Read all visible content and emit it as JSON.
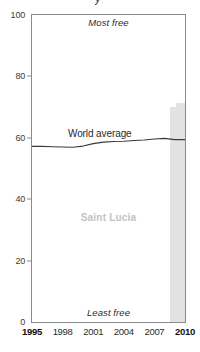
{
  "chart_data": {
    "type": "line",
    "title": "",
    "xlabel": "",
    "ylabel": "",
    "xlim": [
      1995,
      2010
    ],
    "ylim": [
      0,
      100
    ],
    "grid": false,
    "legend_position": "inline-annotation",
    "x_tick_labels": [
      "1995",
      "1998",
      "2001",
      "2004",
      "2007",
      "2010"
    ],
    "x_tick_values": [
      1995,
      1998,
      2001,
      2004,
      2007,
      2010
    ],
    "x_tick_emphasis": [
      true,
      false,
      false,
      false,
      false,
      true
    ],
    "y_tick_labels": [
      "0",
      "20",
      "40",
      "60",
      "80",
      "100"
    ],
    "y_tick_values": [
      0,
      20,
      40,
      60,
      80,
      100
    ],
    "annotations": {
      "top_note": "Most free",
      "bottom_note": "Least free",
      "country_watermark": "Saint Lucia",
      "series_label": "World average"
    },
    "series": [
      {
        "name": "World average",
        "type": "line",
        "color": "#3a3a3a",
        "x": [
          1995,
          1996,
          1997,
          1998,
          1999,
          2000,
          2001,
          2002,
          2003,
          2004,
          2005,
          2006,
          2007,
          2008,
          2009,
          2010
        ],
        "values": [
          57.2,
          57.2,
          57.1,
          57.0,
          56.9,
          57.3,
          58.1,
          58.6,
          58.8,
          58.9,
          59.1,
          59.3,
          59.6,
          59.8,
          59.4,
          59.4
        ]
      },
      {
        "name": "Saint Lucia",
        "type": "bar",
        "color": "#e2e2e2",
        "x": [
          2009,
          2010
        ],
        "values": [
          70.0,
          71.3
        ]
      }
    ]
  },
  "colors": {
    "line": "#3a3a3a",
    "bar": "#e2e2e2",
    "frame": "#8a8a8a",
    "watermark": "#c2c2c2",
    "tick_text": "#2b2b2b"
  }
}
